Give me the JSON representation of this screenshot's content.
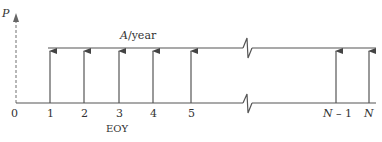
{
  "diagram": {
    "type": "cash-flow-diagram",
    "axis_label": "P",
    "payment_label_symbol": "A",
    "payment_label_unit": "/year",
    "x_axis_label": "EOY",
    "ticks": [
      "0",
      "1",
      "2",
      "3",
      "4",
      "5",
      "N – 1",
      "N"
    ],
    "tick_symbol_n": "N",
    "tick_minus_one": " – 1",
    "colors": {
      "line": "#555555",
      "text": "#333333"
    }
  }
}
